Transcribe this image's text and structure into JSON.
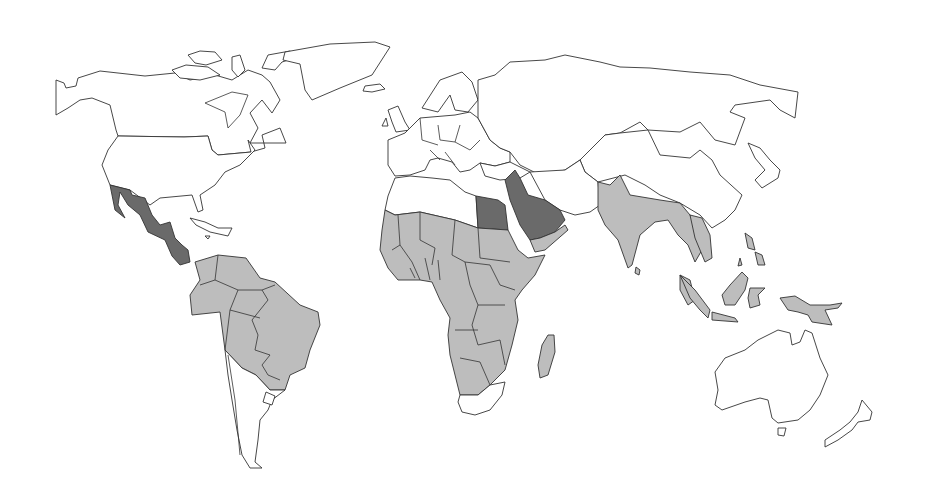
{
  "map": {
    "type": "choropleth",
    "projection": "world",
    "background": "#ffffff",
    "stroke_color": "#333333",
    "legend": null,
    "title": null,
    "categories": [
      {
        "id": "none",
        "color": "#ffffff"
      },
      {
        "id": "mid",
        "color": "#bdbdbd"
      },
      {
        "id": "high",
        "color": "#6a6a6a"
      }
    ],
    "regions": [
      {
        "name": "North America (Canada, USA, Greenland)",
        "category": "none"
      },
      {
        "name": "Mexico & Central America",
        "category": "high"
      },
      {
        "name": "Caribbean",
        "category": "none"
      },
      {
        "name": "South America (north & central)",
        "category": "mid"
      },
      {
        "name": "Chile, Argentina, Uruguay",
        "category": "none"
      },
      {
        "name": "Europe",
        "category": "none"
      },
      {
        "name": "Russia & Central Asia",
        "category": "none"
      },
      {
        "name": "North Africa (Morocco, Algeria, Libya)",
        "category": "none"
      },
      {
        "name": "Egypt",
        "category": "high"
      },
      {
        "name": "Arabian Peninsula & Levant",
        "category": "high"
      },
      {
        "name": "Yemen / Oman",
        "category": "mid"
      },
      {
        "name": "Sub-Saharan Africa",
        "category": "mid"
      },
      {
        "name": "South Africa",
        "category": "none"
      },
      {
        "name": "Madagascar",
        "category": "mid"
      },
      {
        "name": "Iran, Afghanistan, Pakistan",
        "category": "none"
      },
      {
        "name": "India & Southeast Asia",
        "category": "mid"
      },
      {
        "name": "China, Mongolia, Japan",
        "category": "none"
      },
      {
        "name": "Indonesia, Philippines, Papua New Guinea",
        "category": "mid"
      },
      {
        "name": "Australia & New Zealand",
        "category": "none"
      }
    ]
  }
}
